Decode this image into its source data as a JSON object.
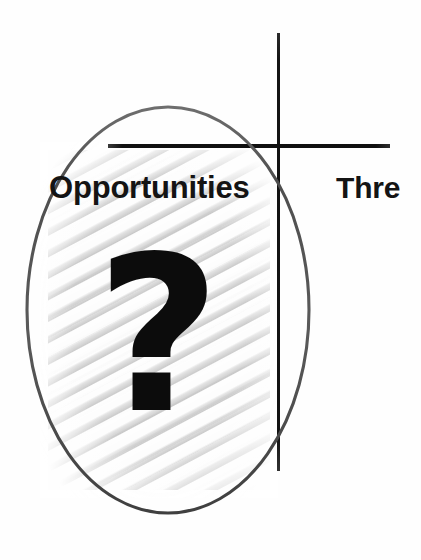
{
  "diagram": {
    "type": "swot-quadrant-fragment",
    "background_color": "#fefefe",
    "axes": {
      "vertical_line_color": "#121212",
      "horizontal_line_color": "#0f0f0f"
    },
    "highlight": {
      "shape": "ellipse",
      "stroke_color": "#5c5c5c",
      "fill": "none"
    },
    "texture_panel": {
      "base_color": "#ebebeb",
      "hatch_color": "#c4c4c4",
      "style": "diagonal-brushed-hatch"
    },
    "quadrants": [
      {
        "id": "opportunities",
        "label": "Opportunities",
        "position": "lower-left",
        "circled": true,
        "symbol": "?",
        "symbol_color": "#0c0c0c",
        "label_color": "#141414"
      },
      {
        "id": "threats",
        "label": "Thre",
        "full_label": "Threats",
        "position": "lower-right",
        "clipped_at_image_edge": true,
        "circled": false,
        "label_color": "#141414"
      }
    ]
  }
}
